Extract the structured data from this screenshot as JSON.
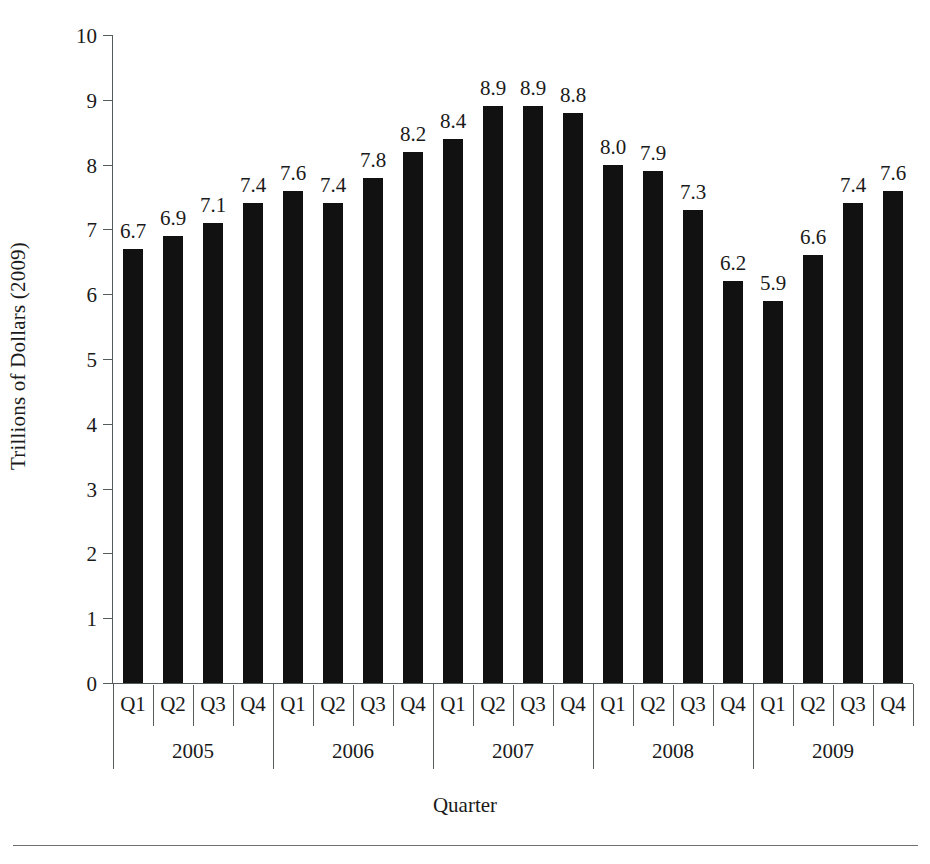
{
  "chart_data": {
    "type": "bar",
    "title": "",
    "xlabel": "Quarter",
    "ylabel": "Trillions of Dollars (2009)",
    "ylim": [
      0,
      10
    ],
    "ytick_labels": [
      "0",
      "1",
      "2",
      "3",
      "4",
      "5",
      "6",
      "7",
      "8",
      "9",
      "10"
    ],
    "ytick_values": [
      0,
      1,
      2,
      3,
      4,
      5,
      6,
      7,
      8,
      9,
      10
    ],
    "grid": false,
    "legend": "none",
    "bar_color": "#111111",
    "axis_color": "#555a5c",
    "categories": [
      "2005 Q1",
      "2005 Q2",
      "2005 Q3",
      "2005 Q4",
      "2006 Q1",
      "2006 Q2",
      "2006 Q3",
      "2006 Q4",
      "2007 Q1",
      "2007 Q2",
      "2007 Q3",
      "2007 Q4",
      "2008 Q1",
      "2008 Q2",
      "2008 Q3",
      "2008 Q4",
      "2009 Q1",
      "2009 Q2",
      "2009 Q3",
      "2009 Q4"
    ],
    "quarter_labels": [
      "Q1",
      "Q2",
      "Q3",
      "Q4",
      "Q1",
      "Q2",
      "Q3",
      "Q4",
      "Q1",
      "Q2",
      "Q3",
      "Q4",
      "Q1",
      "Q2",
      "Q3",
      "Q4",
      "Q1",
      "Q2",
      "Q3",
      "Q4"
    ],
    "year_groups": [
      "2005",
      "2006",
      "2007",
      "2008",
      "2009"
    ],
    "values": [
      6.7,
      6.9,
      7.1,
      7.4,
      7.6,
      7.4,
      7.8,
      8.2,
      8.4,
      8.9,
      8.9,
      8.8,
      8.0,
      7.9,
      7.3,
      6.2,
      5.9,
      6.6,
      7.4,
      7.6
    ],
    "data_labels": [
      "6.7",
      "6.9",
      "7.1",
      "7.4",
      "7.6",
      "7.4",
      "7.8",
      "8.2",
      "8.4",
      "8.9",
      "8.9",
      "8.8",
      "8.0",
      "7.9",
      "7.3",
      "6.2",
      "5.9",
      "6.6",
      "7.4",
      "7.6"
    ]
  }
}
